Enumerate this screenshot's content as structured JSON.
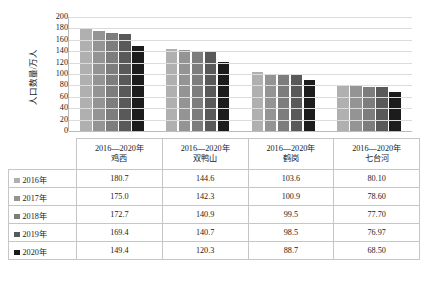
{
  "chart_data": {
    "type": "bar",
    "title": "",
    "xlabel": "",
    "ylabel": "人口数量/万人",
    "ylim": [
      0,
      200
    ],
    "yticks": [
      200,
      180,
      160,
      140,
      120,
      100,
      80,
      60,
      40,
      20,
      0
    ],
    "grid": true,
    "legend_position": "table-below",
    "categories": [
      "鸡西",
      "双鸭山",
      "鹤岗",
      "七台河"
    ],
    "category_range_label": "2016—2020年",
    "series": [
      {
        "name": "2016年",
        "color": "#b0b0b0",
        "values": [
          180.7,
          144.6,
          103.6,
          80.1
        ],
        "display": [
          "180.7",
          "144.6",
          "103.6",
          "80.10"
        ]
      },
      {
        "name": "2017年",
        "color": "#949494",
        "values": [
          175.0,
          142.3,
          100.9,
          78.6
        ],
        "display": [
          "175.0",
          "142.3",
          "100.9",
          "78.60"
        ]
      },
      {
        "name": "2018年",
        "color": "#7d7d7d",
        "values": [
          172.7,
          140.9,
          99.5,
          77.7
        ],
        "display": [
          "172.7",
          "140.9",
          "99.5",
          "77.70"
        ]
      },
      {
        "name": "2019年",
        "color": "#595959",
        "values": [
          169.4,
          140.7,
          98.5,
          76.97
        ],
        "display": [
          "169.4",
          "140.7",
          "98.5",
          "76.97"
        ]
      },
      {
        "name": "2020年",
        "color": "#1c1c1c",
        "values": [
          149.4,
          120.3,
          88.7,
          68.5
        ],
        "display": [
          "149.4",
          "120.3",
          "88.7",
          "68.50"
        ]
      }
    ]
  },
  "table": {
    "header_cells": [
      {
        "line1": "2016—2020年",
        "line2": "鸡西"
      },
      {
        "line1": "2016—2020年",
        "line2": "双鸭山"
      },
      {
        "line1": "2016—2020年",
        "line2": "鹤岗"
      },
      {
        "line1": "2016—2020年",
        "line2": "七台河"
      }
    ],
    "rows": [
      {
        "label": "2016年",
        "color": "#b0b0b0",
        "cells": [
          "180.7",
          "144.6",
          "103.6",
          "80.10"
        ]
      },
      {
        "label": "2017年",
        "color": "#949494",
        "cells": [
          "175.0",
          "142.3",
          "100.9",
          "78.60"
        ]
      },
      {
        "label": "2018年",
        "color": "#7d7d7d",
        "cells": [
          "172.7",
          "140.9",
          "99.5",
          "77.70"
        ]
      },
      {
        "label": "2019年",
        "color": "#595959",
        "cells": [
          "169.4",
          "140.7",
          "98.5",
          "76.97"
        ]
      },
      {
        "label": "2020年",
        "color": "#1c1c1c",
        "cells": [
          "149.4",
          "120.3",
          "88.7",
          "68.50"
        ]
      }
    ]
  }
}
